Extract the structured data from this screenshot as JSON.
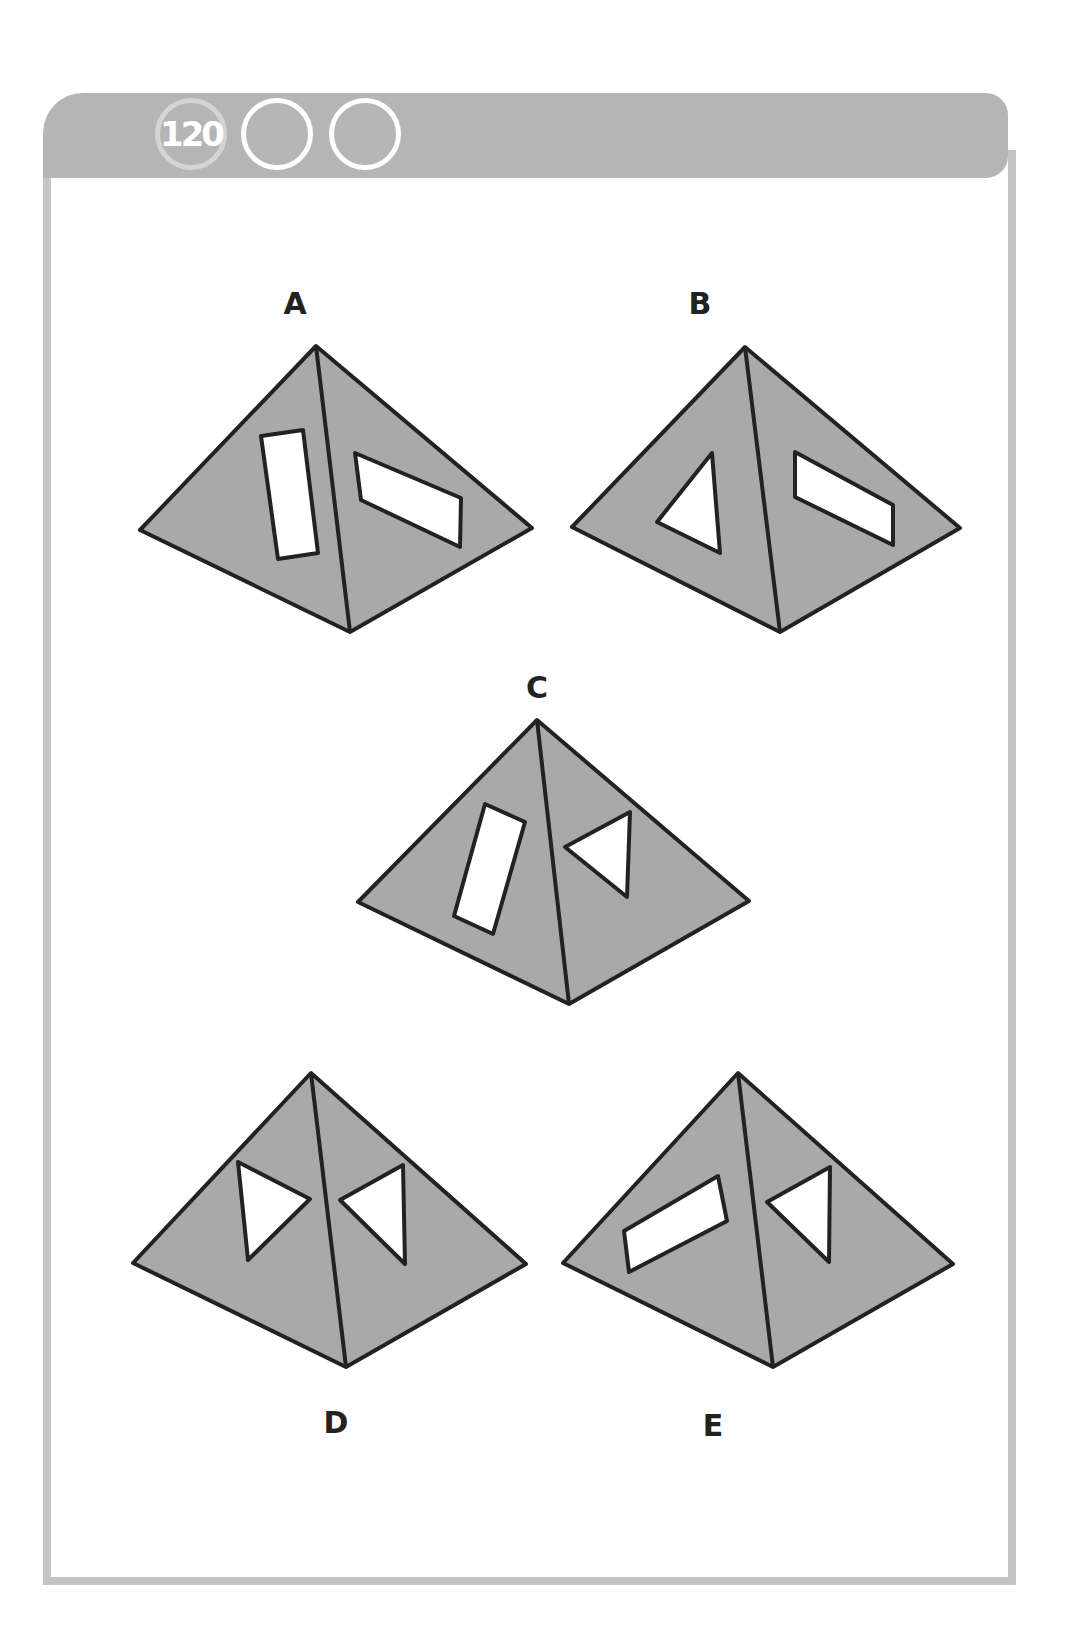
{
  "header": {
    "puzzle_number": "120",
    "circles": [
      "120",
      "",
      ""
    ]
  },
  "options": [
    {
      "label": "A",
      "holes": [
        "rectangle",
        "rectangle"
      ]
    },
    {
      "label": "B",
      "holes": [
        "triangle",
        "rectangle"
      ]
    },
    {
      "label": "C",
      "holes": [
        "rectangle",
        "triangle"
      ]
    },
    {
      "label": "D",
      "holes": [
        "triangle",
        "triangle"
      ]
    },
    {
      "label": "E",
      "holes": [
        "rectangle",
        "triangle"
      ]
    }
  ],
  "colors": {
    "pyramid_fill": "#a9a9a9",
    "outline": "#222222",
    "hole_fill": "#ffffff",
    "header_bar": "#b5b5b5",
    "frame_border": "#c4c4c4"
  }
}
